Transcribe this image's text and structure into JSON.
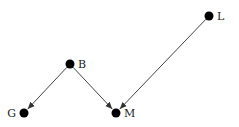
{
  "diagram": {
    "type": "directed-graph",
    "nodes": [
      {
        "id": "L",
        "label": "L",
        "x": 209,
        "y": 16,
        "label_dx": 8,
        "anchor": "start"
      },
      {
        "id": "B",
        "label": "B",
        "x": 70,
        "y": 64,
        "label_dx": 8,
        "anchor": "start"
      },
      {
        "id": "G",
        "label": "G",
        "x": 24,
        "y": 113,
        "label_dx": -8,
        "anchor": "end"
      },
      {
        "id": "M",
        "label": "M",
        "x": 116,
        "y": 113,
        "label_dx": 8,
        "anchor": "start"
      }
    ],
    "edges": [
      {
        "from": "B",
        "to": "G"
      },
      {
        "from": "B",
        "to": "M"
      },
      {
        "from": "L",
        "to": "M"
      }
    ],
    "colors": {
      "node": "#000000",
      "edge": "#444444",
      "label": "#222222"
    }
  }
}
